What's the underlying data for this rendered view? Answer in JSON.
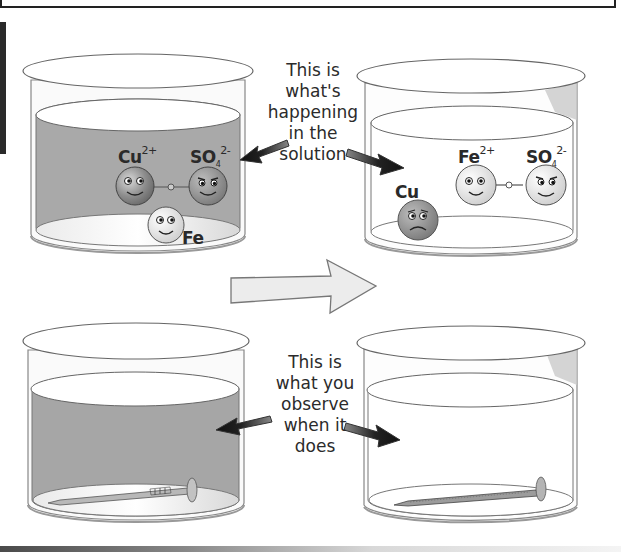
{
  "diagram": {
    "topic": "Displacement reaction: iron nail in copper sulfate solution",
    "captions": {
      "solution": [
        "This is",
        "what's",
        "happening",
        "in the",
        "solution"
      ],
      "observe": [
        "This is",
        "what you",
        "observe",
        "when it",
        "does"
      ]
    },
    "before_solution": {
      "liquid_color": "#a8a8a8",
      "ions": [
        {
          "label": "Cu",
          "charge": "2+",
          "face": "happy"
        },
        {
          "label": "SO",
          "subscript": "4",
          "charge": "2-",
          "face": "mischievous"
        }
      ],
      "atom": {
        "label": "Fe",
        "face": "happy"
      }
    },
    "after_solution": {
      "liquid_color": "#ffffff",
      "ions": [
        {
          "label": "Fe",
          "charge": "2+",
          "face": "happy"
        },
        {
          "label": "SO",
          "subscript": "4",
          "charge": "2-",
          "face": "mischievous"
        }
      ],
      "atom": {
        "label": "Cu",
        "face": "sad"
      }
    },
    "before_observed": {
      "liquid_color": "#a8a8a8",
      "object": "iron-nail"
    },
    "after_observed": {
      "liquid_color": "#ffffff",
      "object": "copper-coated-nail"
    },
    "transition_arrow": "right"
  }
}
